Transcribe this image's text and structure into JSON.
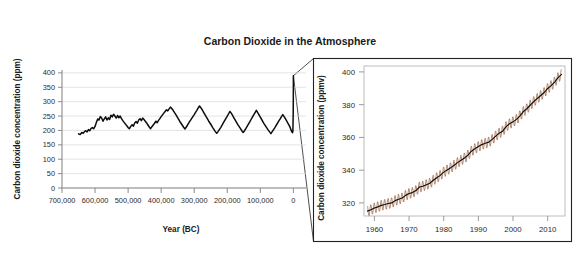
{
  "figure": {
    "title": "Carbon Dioxide in the Atmosphere",
    "background_color": "#ffffff"
  },
  "chart_data": [
    {
      "id": "ice-core-panel",
      "type": "line",
      "title": "",
      "xlabel": "Year (BC)",
      "ylabel": "Carbon dioxide concentration (ppm)",
      "xlim": [
        700000,
        -20000
      ],
      "ylim": [
        0,
        410
      ],
      "x_axis_direction": "reversed",
      "grid": "horizontal",
      "legend": "none",
      "line_color": "#0d0d0d",
      "xticks": [
        700000,
        600000,
        500000,
        400000,
        300000,
        200000,
        100000,
        0
      ],
      "xtick_labels": [
        "700,000",
        "600,000",
        "500,000",
        "400,000",
        "300,000",
        "200,000",
        "100,000",
        "0"
      ],
      "yticks": [
        0,
        50,
        100,
        150,
        200,
        250,
        300,
        350,
        400
      ],
      "ytick_labels": [
        "0",
        "50",
        "100",
        "150",
        "200",
        "250",
        "300",
        "350",
        "400"
      ],
      "x": [
        650000,
        645000,
        640000,
        636000,
        632000,
        628000,
        624000,
        620000,
        616000,
        612000,
        608000,
        604000,
        600000,
        596000,
        592000,
        588000,
        584000,
        580000,
        576000,
        572000,
        568000,
        564000,
        560000,
        556000,
        552000,
        548000,
        544000,
        540000,
        536000,
        532000,
        528000,
        524000,
        520000,
        516000,
        512000,
        508000,
        504000,
        500000,
        496000,
        492000,
        488000,
        484000,
        480000,
        476000,
        472000,
        468000,
        464000,
        460000,
        456000,
        452000,
        448000,
        444000,
        440000,
        436000,
        432000,
        428000,
        424000,
        420000,
        416000,
        412000,
        408000,
        404000,
        400000,
        396000,
        392000,
        388000,
        384000,
        380000,
        376000,
        372000,
        368000,
        364000,
        360000,
        356000,
        352000,
        348000,
        344000,
        340000,
        336000,
        332000,
        328000,
        324000,
        320000,
        316000,
        312000,
        308000,
        304000,
        300000,
        296000,
        292000,
        288000,
        284000,
        280000,
        276000,
        272000,
        268000,
        264000,
        260000,
        256000,
        252000,
        248000,
        244000,
        240000,
        236000,
        232000,
        228000,
        224000,
        220000,
        216000,
        212000,
        208000,
        204000,
        200000,
        196000,
        192000,
        188000,
        184000,
        180000,
        176000,
        172000,
        168000,
        164000,
        160000,
        156000,
        152000,
        148000,
        144000,
        140000,
        136000,
        132000,
        128000,
        124000,
        120000,
        116000,
        112000,
        108000,
        104000,
        100000,
        96000,
        92000,
        88000,
        84000,
        80000,
        76000,
        72000,
        68000,
        64000,
        60000,
        56000,
        52000,
        48000,
        44000,
        40000,
        36000,
        32000,
        28000,
        24000,
        20000,
        16000,
        12000,
        9000,
        7000,
        5000,
        3000,
        1500,
        500,
        200,
        50,
        0
      ],
      "y": [
        188,
        186,
        193,
        190,
        196,
        199,
        195,
        203,
        199,
        207,
        210,
        206,
        214,
        228,
        240,
        236,
        248,
        243,
        232,
        240,
        247,
        236,
        244,
        238,
        253,
        247,
        256,
        250,
        243,
        252,
        244,
        250,
        241,
        234,
        228,
        222,
        216,
        210,
        206,
        214,
        220,
        215,
        226,
        231,
        225,
        236,
        241,
        234,
        243,
        238,
        232,
        226,
        219,
        212,
        206,
        213,
        219,
        225,
        232,
        227,
        235,
        241,
        248,
        254,
        260,
        266,
        272,
        268,
        275,
        281,
        276,
        270,
        263,
        256,
        248,
        240,
        232,
        225,
        218,
        211,
        205,
        212,
        219,
        227,
        234,
        241,
        248,
        255,
        263,
        270,
        278,
        285,
        279,
        272,
        264,
        256,
        248,
        240,
        232,
        225,
        218,
        210,
        203,
        196,
        190,
        196,
        203,
        210,
        218,
        226,
        234,
        242,
        250,
        258,
        266,
        260,
        252,
        244,
        236,
        228,
        220,
        213,
        206,
        199,
        193,
        199,
        206,
        214,
        222,
        230,
        238,
        246,
        254,
        262,
        270,
        262,
        254,
        246,
        238,
        230,
        222,
        215,
        208,
        201,
        195,
        189,
        196,
        203,
        210,
        218,
        225,
        233,
        240,
        248,
        255,
        248,
        240,
        232,
        224,
        216,
        208,
        201,
        196,
        192,
        196,
        260,
        315,
        360,
        390
      ]
    },
    {
      "id": "modern-keeling-panel",
      "type": "line",
      "title": "",
      "xlabel": "",
      "ylabel": "Carbon dioxide concentration (ppmv)",
      "xlim": [
        1957,
        2015
      ],
      "ylim": [
        312,
        403
      ],
      "grid": "none",
      "legend": "none",
      "trend_color": "#0d0d0d",
      "seasonal_color": "#8c4a24",
      "seasonal_amplitude_ppm": 3.2,
      "xticks": [
        1960,
        1970,
        1980,
        1990,
        2000,
        2010
      ],
      "xtick_labels": [
        "1960",
        "1970",
        "1980",
        "1990",
        "2000",
        "2010"
      ],
      "yticks": [
        320,
        340,
        360,
        380,
        400
      ],
      "ytick_labels": [
        "320",
        "340",
        "360",
        "380",
        "400"
      ],
      "x": [
        1958,
        1959,
        1960,
        1961,
        1962,
        1963,
        1964,
        1965,
        1966,
        1967,
        1968,
        1969,
        1970,
        1971,
        1972,
        1973,
        1974,
        1975,
        1976,
        1977,
        1978,
        1979,
        1980,
        1981,
        1982,
        1983,
        1984,
        1985,
        1986,
        1987,
        1988,
        1989,
        1990,
        1991,
        1992,
        1993,
        1994,
        1995,
        1996,
        1997,
        1998,
        1999,
        2000,
        2001,
        2002,
        2003,
        2004,
        2005,
        2006,
        2007,
        2008,
        2009,
        2010,
        2011,
        2012,
        2013,
        2014
      ],
      "y": [
        315.0,
        315.8,
        316.9,
        317.6,
        318.5,
        319.0,
        319.6,
        320.0,
        321.4,
        322.2,
        323.0,
        324.6,
        325.7,
        326.3,
        327.5,
        329.7,
        330.2,
        331.1,
        332.0,
        333.8,
        335.4,
        336.8,
        338.8,
        340.1,
        341.4,
        343.0,
        344.6,
        346.0,
        347.4,
        349.2,
        351.6,
        353.1,
        354.4,
        355.6,
        356.4,
        357.1,
        358.8,
        360.8,
        362.6,
        363.8,
        366.6,
        368.3,
        369.5,
        371.0,
        373.2,
        375.8,
        377.5,
        379.8,
        381.9,
        383.8,
        385.6,
        387.4,
        389.9,
        391.6,
        393.8,
        396.5,
        398.5
      ]
    }
  ]
}
